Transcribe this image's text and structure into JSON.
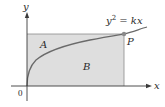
{
  "diagram": {
    "axes": {
      "x_label": "x",
      "y_label": "y",
      "origin_label": "0"
    },
    "curve": {
      "equation_lhs": "y",
      "equation_exp": "2",
      "equation_rhs": " = kx"
    },
    "point": {
      "label": "P"
    },
    "regions": [
      {
        "label": "A"
      },
      {
        "label": "B"
      }
    ],
    "colors": {
      "region_fill": "#dedede",
      "axis": "#3a3a3a",
      "curve": "#5a5a5a",
      "point": "#7a7a7a"
    }
  }
}
